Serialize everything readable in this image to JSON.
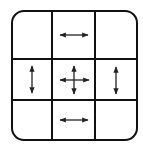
{
  "diagram": {
    "type": "nine-slice-grid",
    "rows": 3,
    "cols": 3,
    "stroke_color": "#111111",
    "arrow_color": "#222222",
    "cells": [
      {
        "id": "top-left",
        "arrow": "none"
      },
      {
        "id": "top-center",
        "arrow": "horizontal"
      },
      {
        "id": "top-right",
        "arrow": "none"
      },
      {
        "id": "middle-left",
        "arrow": "vertical"
      },
      {
        "id": "center",
        "arrow": "both"
      },
      {
        "id": "middle-right",
        "arrow": "vertical"
      },
      {
        "id": "bottom-left",
        "arrow": "none"
      },
      {
        "id": "bottom-center",
        "arrow": "horizontal"
      },
      {
        "id": "bottom-right",
        "arrow": "none"
      }
    ]
  }
}
